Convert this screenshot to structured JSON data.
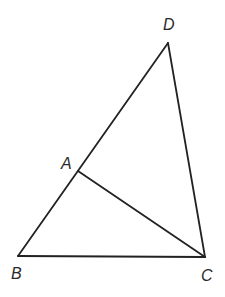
{
  "diagram": {
    "type": "geometry-triangle",
    "stroke_color": "#222222",
    "label_color": "#2a2a2a",
    "points": {
      "D": {
        "label": "D",
        "x": 168,
        "y": 43
      },
      "A": {
        "label": "A",
        "x": 78,
        "y": 171
      },
      "B": {
        "label": "B",
        "x": 18,
        "y": 256
      },
      "C": {
        "label": "C",
        "x": 205,
        "y": 257
      }
    },
    "segments": [
      {
        "from": "B",
        "to": "D",
        "name": "BD"
      },
      {
        "from": "D",
        "to": "C",
        "name": "DC"
      },
      {
        "from": "B",
        "to": "C",
        "name": "BC"
      },
      {
        "from": "A",
        "to": "C",
        "name": "AC"
      }
    ],
    "labels": {
      "D": "D",
      "A": "A",
      "B": "B",
      "C": "C"
    }
  }
}
